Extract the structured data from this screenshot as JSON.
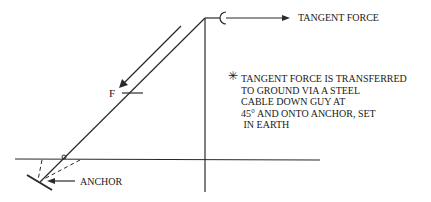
{
  "diagram": {
    "labels": {
      "tangent_force": "TANGENT FORCE",
      "force_symbol": "F",
      "anchor": "ANCHOR",
      "note_marker": "✳"
    },
    "note_lines": [
      "TANGENT FORCE IS TRANSFERRED",
      "TO GROUND VIA A STEEL",
      "CABLE DOWN GUY AT",
      "45° AND ONTO ANCHOR, SET",
      " IN EARTH"
    ],
    "colors": {
      "line": "#2a2a2a",
      "background": "#ffffff"
    }
  }
}
